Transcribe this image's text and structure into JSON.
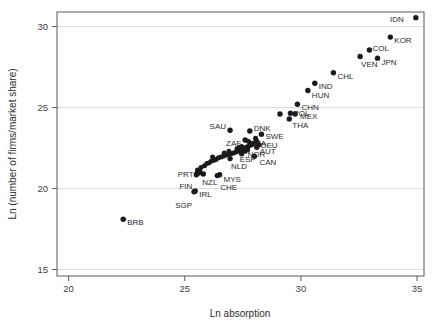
{
  "chart_data": {
    "type": "scatter",
    "title": "",
    "subtitle": "",
    "xlabel": "Ln absorption",
    "ylabel": "Ln (number of firms/market share)",
    "xlim": [
      19.5,
      35.3
    ],
    "ylim": [
      14.6,
      30.9
    ],
    "xticks": [
      20,
      25,
      30,
      35
    ],
    "yticks": [
      15,
      20,
      25,
      30
    ],
    "xtick_labels": [
      "20",
      "25",
      "30",
      "35"
    ],
    "ytick_labels": [
      "15",
      "20",
      "25",
      "30"
    ],
    "grid": "horizontal",
    "legend": "none",
    "marker": "filled-circle",
    "marker_color": "#1a1a1a",
    "grid_color": "#d9d9d9",
    "axis_color": "#58595b",
    "background": "#ffffff",
    "points": [
      {
        "label": "IDN",
        "x": 34.95,
        "y": 30.55,
        "lx": -12,
        "ly": 1,
        "anchor": "end"
      },
      {
        "label": "KOR",
        "x": 33.85,
        "y": 29.35,
        "lx": 4,
        "ly": 3,
        "anchor": "start"
      },
      {
        "label": "COL",
        "x": 32.95,
        "y": 28.55,
        "lx": 3,
        "ly": -2,
        "anchor": "start"
      },
      {
        "label": "VEN",
        "x": 32.55,
        "y": 28.15,
        "lx": 1,
        "ly": 7,
        "anchor": "start"
      },
      {
        "label": "JPN",
        "x": 33.3,
        "y": 28.05,
        "lx": 4,
        "ly": 4,
        "anchor": "start"
      },
      {
        "label": "CHL",
        "x": 31.4,
        "y": 27.15,
        "lx": 4,
        "ly": 3,
        "anchor": "start"
      },
      {
        "label": "IND",
        "x": 30.6,
        "y": 26.5,
        "lx": 4,
        "ly": 3,
        "anchor": "start"
      },
      {
        "label": "HUN",
        "x": 30.3,
        "y": 26.05,
        "lx": 4,
        "ly": 4,
        "anchor": "start"
      },
      {
        "label": "CHN",
        "x": 29.85,
        "y": 25.2,
        "lx": 4,
        "ly": 3,
        "anchor": "start"
      },
      {
        "label": "POL",
        "x": 29.55,
        "y": 24.65,
        "lx": 3,
        "ly": 0,
        "anchor": "start"
      },
      {
        "label": "MEX",
        "x": 29.75,
        "y": 24.6,
        "lx": 5,
        "ly": 2,
        "anchor": "start"
      },
      {
        "label": "THA",
        "x": 29.5,
        "y": 24.3,
        "lx": 3,
        "ly": 6,
        "anchor": "start"
      },
      {
        "label": "PER",
        "x": 29.1,
        "y": 24.6,
        "lx": 0,
        "ly": 0,
        "anchor": "none"
      },
      {
        "label": "SAU",
        "x": 26.95,
        "y": 23.6,
        "lx": -4,
        "ly": -4,
        "anchor": "end"
      },
      {
        "label": "DNK",
        "x": 27.8,
        "y": 23.55,
        "lx": 4,
        "ly": -3,
        "anchor": "start"
      },
      {
        "label": "SWE",
        "x": 28.3,
        "y": 23.35,
        "lx": 4,
        "ly": 2,
        "anchor": "start"
      },
      {
        "label": "ZAF",
        "x": 27.6,
        "y": 23.0,
        "lx": -4,
        "ly": 3,
        "anchor": "end"
      },
      {
        "label": "DEU",
        "x": 28.1,
        "y": 22.9,
        "lx": 4,
        "ly": 3,
        "anchor": "start"
      },
      {
        "label": "ITA",
        "x": 27.9,
        "y": 22.75,
        "lx": 2,
        "ly": -1,
        "anchor": "start"
      },
      {
        "label": "AUT",
        "x": 28.1,
        "y": 22.55,
        "lx": 3,
        "ly": 4,
        "anchor": "start"
      },
      {
        "label": "NOR",
        "x": 27.7,
        "y": 22.4,
        "lx": 0,
        "ly": 4,
        "anchor": "start"
      },
      {
        "label": "ESP",
        "x": 27.45,
        "y": 22.15,
        "lx": -2,
        "ly": 5,
        "anchor": "start"
      },
      {
        "label": "CAN",
        "x": 28.0,
        "y": 22.0,
        "lx": 5,
        "ly": 6,
        "anchor": "start"
      },
      {
        "label": "NLD",
        "x": 26.95,
        "y": 21.85,
        "lx": 1,
        "ly": 7,
        "anchor": "start"
      },
      {
        "label": "PRT",
        "x": 25.55,
        "y": 21.0,
        "lx": -4,
        "ly": 2,
        "anchor": "end"
      },
      {
        "label": "NZL",
        "x": 25.8,
        "y": 20.9,
        "lx": -1,
        "ly": 8,
        "anchor": "start"
      },
      {
        "label": "MYS",
        "x": 26.5,
        "y": 20.85,
        "lx": 4,
        "ly": 4,
        "anchor": "start"
      },
      {
        "label": "CHE",
        "x": 26.4,
        "y": 20.8,
        "lx": 3,
        "ly": 11,
        "anchor": "start"
      },
      {
        "label": "FIN",
        "x": 25.5,
        "y": 20.85,
        "lx": -4,
        "ly": 11,
        "anchor": "end"
      },
      {
        "label": "IRL",
        "x": 25.45,
        "y": 19.85,
        "lx": 4,
        "ly": 3,
        "anchor": "start"
      },
      {
        "label": "SGP",
        "x": 25.4,
        "y": 19.8,
        "lx": -2,
        "ly": 13,
        "anchor": "end"
      },
      {
        "label": "BRB",
        "x": 22.35,
        "y": 18.1,
        "lx": 4,
        "ly": 3,
        "anchor": "start"
      }
    ],
    "unlabeled_points": [
      {
        "x": 25.55,
        "y": 21.15
      },
      {
        "x": 25.7,
        "y": 21.3
      },
      {
        "x": 25.85,
        "y": 21.4
      },
      {
        "x": 25.95,
        "y": 21.55
      },
      {
        "x": 26.05,
        "y": 21.6
      },
      {
        "x": 26.15,
        "y": 21.7
      },
      {
        "x": 26.25,
        "y": 21.75
      },
      {
        "x": 26.35,
        "y": 21.8
      },
      {
        "x": 26.45,
        "y": 21.9
      },
      {
        "x": 26.55,
        "y": 21.95
      },
      {
        "x": 26.65,
        "y": 22.0
      },
      {
        "x": 26.75,
        "y": 22.05
      },
      {
        "x": 26.85,
        "y": 22.1
      },
      {
        "x": 27.0,
        "y": 22.15
      },
      {
        "x": 27.1,
        "y": 22.2
      },
      {
        "x": 27.2,
        "y": 22.25
      },
      {
        "x": 27.3,
        "y": 22.3
      },
      {
        "x": 27.4,
        "y": 22.35
      },
      {
        "x": 27.5,
        "y": 22.4
      },
      {
        "x": 27.58,
        "y": 22.48
      },
      {
        "x": 27.65,
        "y": 22.55
      },
      {
        "x": 27.72,
        "y": 22.6
      },
      {
        "x": 27.8,
        "y": 22.65
      },
      {
        "x": 27.88,
        "y": 22.7
      },
      {
        "x": 27.95,
        "y": 22.8
      },
      {
        "x": 28.02,
        "y": 22.85
      },
      {
        "x": 27.45,
        "y": 22.6
      },
      {
        "x": 27.35,
        "y": 22.55
      },
      {
        "x": 27.25,
        "y": 22.45
      },
      {
        "x": 26.9,
        "y": 22.3
      },
      {
        "x": 26.7,
        "y": 22.2
      },
      {
        "x": 26.2,
        "y": 21.95
      },
      {
        "x": 25.65,
        "y": 21.05
      },
      {
        "x": 25.6,
        "y": 20.95
      },
      {
        "x": 28.2,
        "y": 22.7
      },
      {
        "x": 27.6,
        "y": 22.3
      },
      {
        "x": 27.75,
        "y": 22.9
      },
      {
        "x": 28.05,
        "y": 23.1
      }
    ]
  }
}
